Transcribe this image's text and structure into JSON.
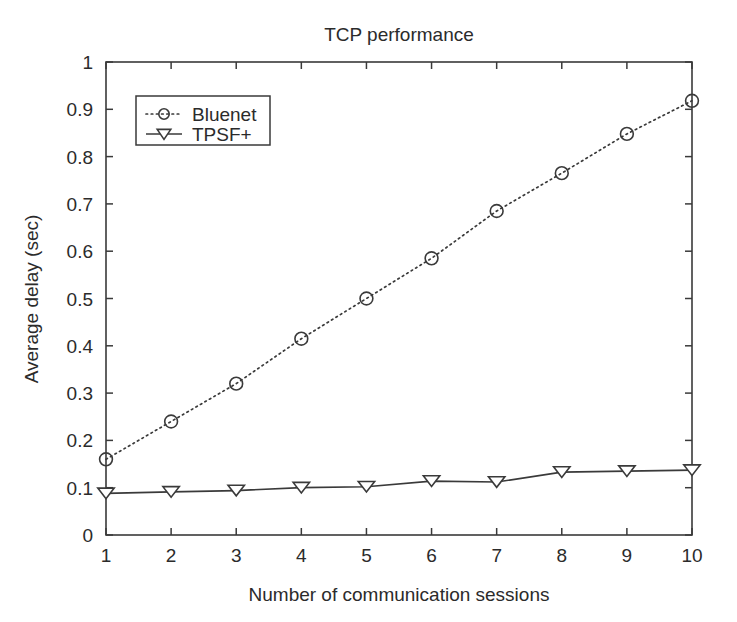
{
  "chart_data": {
    "type": "line",
    "title": "TCP performance",
    "xlabel": "Number of communication sessions",
    "ylabel": "Average delay (sec)",
    "x": [
      1,
      2,
      3,
      4,
      5,
      6,
      7,
      8,
      9,
      10
    ],
    "xlim": [
      1,
      10
    ],
    "ylim": [
      0,
      1
    ],
    "xticks": [
      "1",
      "2",
      "3",
      "4",
      "5",
      "6",
      "7",
      "8",
      "9",
      "10"
    ],
    "yticks": [
      "0",
      "0.1",
      "0.2",
      "0.3",
      "0.4",
      "0.5",
      "0.6",
      "0.7",
      "0.8",
      "0.9",
      "1"
    ],
    "grid": false,
    "legend_position": "upper left",
    "series": [
      {
        "name": "Bluenet",
        "marker": "circle",
        "linestyle": "dotted",
        "color": "#3a3a3a",
        "values": [
          0.16,
          0.24,
          0.32,
          0.415,
          0.5,
          0.585,
          0.685,
          0.765,
          0.848,
          0.918
        ]
      },
      {
        "name": "TPSF+",
        "marker": "triangle-down",
        "linestyle": "solid",
        "color": "#3a3a3a",
        "values": [
          0.088,
          0.091,
          0.094,
          0.1,
          0.102,
          0.114,
          0.112,
          0.133,
          0.135,
          0.137
        ]
      }
    ]
  },
  "figure": {
    "background_color": "#ffffff",
    "line_color": "#3a3a3a"
  }
}
